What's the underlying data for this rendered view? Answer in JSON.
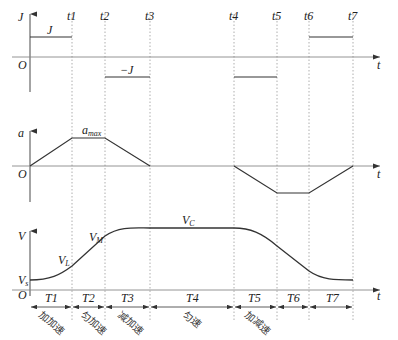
{
  "jerk_panel": {
    "y_axis_label": "J",
    "origin_label": "O",
    "x_axis_label": "t",
    "positive_label": "J",
    "negative_label": "−J",
    "time_marks": [
      "t1",
      "t2",
      "t3",
      "t4",
      "t5",
      "t6",
      "t7"
    ]
  },
  "accel_panel": {
    "y_axis_label": "a",
    "origin_label": "O",
    "x_axis_label": "t",
    "max_label_main": "a",
    "max_label_sub": "max"
  },
  "velocity_panel": {
    "y_axis_label": "V",
    "origin_label": "O",
    "x_axis_label": "t",
    "vs_main": "V",
    "vs_sub": "s",
    "vl_main": "V",
    "vl_sub": "L",
    "vm_main": "V",
    "vm_sub": "M",
    "vc_main": "V",
    "vc_sub": "C"
  },
  "intervals": [
    {
      "label": "T1",
      "phase": "加加速"
    },
    {
      "label": "T2",
      "phase": "匀加速"
    },
    {
      "label": "T3",
      "phase": "减加速"
    },
    {
      "label": "T4",
      "phase": "匀速"
    },
    {
      "label": "T5",
      "phase": "加减速"
    },
    {
      "label": "T6",
      "phase": ""
    },
    {
      "label": "T7",
      "phase": ""
    }
  ],
  "colors": {
    "curve": "#333333",
    "axis": "#555555",
    "guide": "#9a9a9a"
  }
}
